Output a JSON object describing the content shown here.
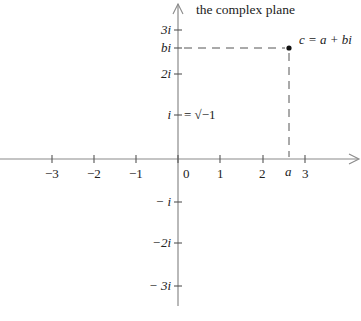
{
  "title": "the complex plane",
  "colors": {
    "axis": "#8a8a8a",
    "text": "#222222",
    "dash": "#555555",
    "point": "#111111"
  },
  "x_axis": {
    "ticks": [
      {
        "value": -3,
        "label": "−3"
      },
      {
        "value": -2,
        "label": "−2"
      },
      {
        "value": -1,
        "label": "−1"
      },
      {
        "value": 0,
        "label": "0"
      },
      {
        "value": 1,
        "label": "1"
      },
      {
        "value": 2,
        "label": "2"
      },
      {
        "value": 3,
        "label": "3"
      }
    ],
    "a_label": "a"
  },
  "y_axis": {
    "ticks": [
      {
        "value": 3,
        "label": "3i"
      },
      {
        "value": 2,
        "label": "2i"
      },
      {
        "value": 1,
        "label": "i"
      },
      {
        "value": -1,
        "label": "− i"
      },
      {
        "value": -2,
        "label": "−2i"
      },
      {
        "value": -3,
        "label": "− 3i"
      }
    ],
    "bi_label": "bi",
    "i_definition": "= √−1"
  },
  "point": {
    "label": "c = a + bi",
    "a": 2.6,
    "b": 2.6
  }
}
